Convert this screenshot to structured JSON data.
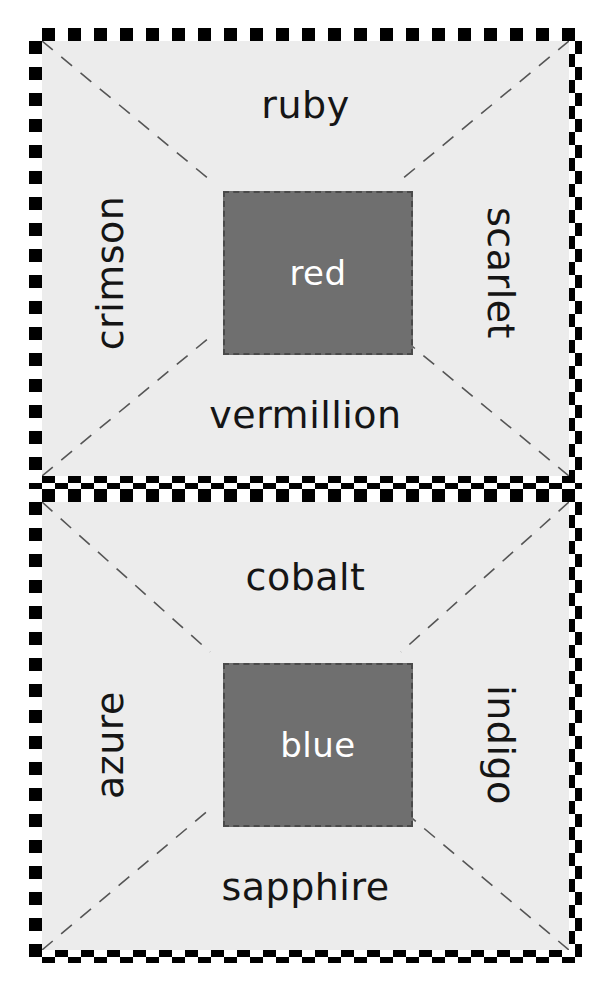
{
  "page": {
    "background_color": "#ffffff",
    "card_background_color": "#ececec",
    "swatch_color": "#6f6f6f",
    "swatch_text_color": "#ffffff",
    "word_text_color": "#151515",
    "checker_dark_color": "#000000",
    "checker_light_color": "#ffffff",
    "scallop_color": "#9a9a9a",
    "dash_color": "#555555"
  },
  "cards": [
    {
      "id": "red-card",
      "center_label": "red",
      "top_label": "ruby",
      "left_label": "crimson",
      "right_label": "scarlet",
      "bottom_label": "vermillion"
    },
    {
      "id": "blue-card",
      "center_label": "blue",
      "top_label": "cobalt",
      "left_label": "azure",
      "right_label": "indigo",
      "bottom_label": "sapphire"
    }
  ]
}
